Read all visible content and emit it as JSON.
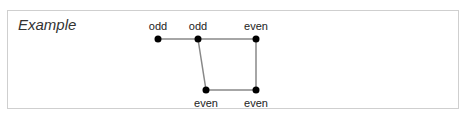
{
  "title": "Example",
  "graph": {
    "nodes": [
      {
        "id": "n1",
        "label": "odd",
        "x": 158,
        "y": 39,
        "label_pos": "above"
      },
      {
        "id": "n2",
        "label": "odd",
        "x": 198,
        "y": 39,
        "label_pos": "above"
      },
      {
        "id": "n3",
        "label": "even",
        "x": 256,
        "y": 39,
        "label_pos": "above"
      },
      {
        "id": "n4",
        "label": "even",
        "x": 206,
        "y": 90,
        "label_pos": "below"
      },
      {
        "id": "n5",
        "label": "even",
        "x": 256,
        "y": 90,
        "label_pos": "below"
      }
    ],
    "edges": [
      [
        "n1",
        "n2"
      ],
      [
        "n2",
        "n3"
      ],
      [
        "n2",
        "n4"
      ],
      [
        "n3",
        "n5"
      ],
      [
        "n4",
        "n5"
      ]
    ],
    "colors": {
      "edge": "#888888",
      "node": "#000000"
    }
  }
}
